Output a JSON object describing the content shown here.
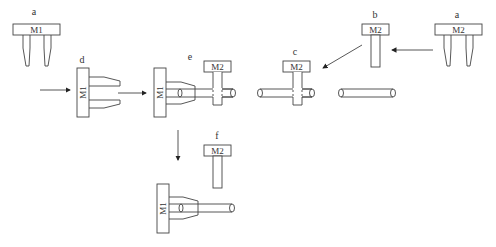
{
  "diagram": {
    "title": "",
    "labels": {
      "a_left": "a",
      "a_right": "a",
      "b": "b",
      "c": "c",
      "d": "d",
      "e": "e",
      "f": "f"
    },
    "modules": {
      "m1": "M1",
      "m2": "M2"
    },
    "components": [
      {
        "id": "a-left",
        "label": "a",
        "module": "M1",
        "shape": "horizontal bar with two tapered prongs pointing down"
      },
      {
        "id": "d",
        "label": "d",
        "module": "M1",
        "shape": "vertical bar with two tapered prongs pointing right"
      },
      {
        "id": "e",
        "label": "e",
        "module": "M1 + M2",
        "shape": "M1 gripping rod through M2 post"
      },
      {
        "id": "c",
        "label": "c",
        "module": "M2",
        "shape": "M2 post inserted through rod"
      },
      {
        "id": "b",
        "label": "b",
        "module": "M2",
        "shape": "horizontal bar with single post"
      },
      {
        "id": "a-right",
        "label": "a",
        "module": "M2",
        "shape": "horizontal bar with two tapered prongs pointing down"
      },
      {
        "id": "f",
        "label": "f",
        "module": "M2",
        "shape": "M2 post separated"
      },
      {
        "id": "final",
        "label": "",
        "module": "M1",
        "shape": "M1 gripping rod alone"
      }
    ],
    "arrows": [
      {
        "from": "left-margin",
        "to": "d"
      },
      {
        "from": "d",
        "to": "e"
      },
      {
        "from": "a-right",
        "to": "b"
      },
      {
        "from": "b",
        "to": "c"
      },
      {
        "from": "e",
        "to": "final"
      }
    ]
  }
}
